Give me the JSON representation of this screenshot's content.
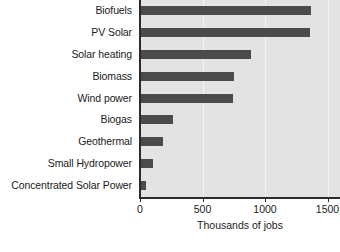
{
  "chart_data": {
    "type": "bar",
    "orientation": "horizontal",
    "title": "",
    "subtitle": "",
    "xlabel": "Thousands of jobs",
    "ylabel": "",
    "categories": [
      "Biofuels",
      "PV Solar",
      "Solar heating",
      "Biomass",
      "Wind power",
      "Biogas",
      "Geothermal",
      "Small Hydropower",
      "Concentrated Solar Power"
    ],
    "values": [
      1370,
      1360,
      890,
      750,
      745,
      265,
      180,
      100,
      45
    ],
    "xlim": [
      0,
      1600
    ],
    "xticks": [
      0,
      500,
      1000,
      1500
    ],
    "xticklabels": [
      "0",
      "500",
      "1000",
      "1500"
    ],
    "grid": true,
    "grid_axis": "x",
    "legend": false,
    "legend_position": "none",
    "bar_color": "#4b4b4b",
    "plot_background": "#e3e3e3",
    "gridline_color": "#f4f4f4",
    "axis_color": "#2b2b2b",
    "text_color": "#1b1b1b"
  }
}
